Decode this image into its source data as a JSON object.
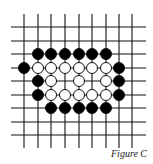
{
  "figure": {
    "caption": "Figure C",
    "grid": {
      "size": 9,
      "x_positions": [
        24,
        38,
        51,
        65,
        79,
        92,
        106,
        119,
        132
      ],
      "y_positions": [
        27,
        41,
        54,
        68,
        81,
        95,
        108,
        122,
        135
      ],
      "line_left": 11,
      "line_right": 146,
      "line_top": 14,
      "line_bottom": 148,
      "line_color": "#111111"
    },
    "stone_radius": 5.5,
    "colors": {
      "black": "#000000",
      "white": "#ffffff",
      "outline": "#111111"
    },
    "stones": [
      {
        "row": 2,
        "col": 1,
        "color": "black"
      },
      {
        "row": 2,
        "col": 2,
        "color": "black"
      },
      {
        "row": 2,
        "col": 3,
        "color": "black"
      },
      {
        "row": 2,
        "col": 4,
        "color": "black"
      },
      {
        "row": 2,
        "col": 5,
        "color": "black"
      },
      {
        "row": 2,
        "col": 6,
        "color": "black"
      },
      {
        "row": 3,
        "col": 0,
        "color": "black"
      },
      {
        "row": 3,
        "col": 1,
        "color": "white"
      },
      {
        "row": 3,
        "col": 2,
        "color": "white"
      },
      {
        "row": 3,
        "col": 3,
        "color": "white"
      },
      {
        "row": 3,
        "col": 4,
        "color": "white"
      },
      {
        "row": 3,
        "col": 5,
        "color": "white"
      },
      {
        "row": 3,
        "col": 6,
        "color": "white"
      },
      {
        "row": 3,
        "col": 7,
        "color": "black"
      },
      {
        "row": 4,
        "col": 1,
        "color": "black"
      },
      {
        "row": 4,
        "col": 2,
        "color": "white"
      },
      {
        "row": 4,
        "col": 4,
        "color": "white"
      },
      {
        "row": 4,
        "col": 6,
        "color": "white"
      },
      {
        "row": 4,
        "col": 7,
        "color": "black"
      },
      {
        "row": 5,
        "col": 1,
        "color": "black"
      },
      {
        "row": 5,
        "col": 2,
        "color": "white"
      },
      {
        "row": 5,
        "col": 3,
        "color": "white"
      },
      {
        "row": 5,
        "col": 4,
        "color": "white"
      },
      {
        "row": 5,
        "col": 5,
        "color": "white"
      },
      {
        "row": 5,
        "col": 6,
        "color": "white"
      },
      {
        "row": 5,
        "col": 7,
        "color": "black"
      },
      {
        "row": 6,
        "col": 2,
        "color": "black"
      },
      {
        "row": 6,
        "col": 3,
        "color": "black"
      },
      {
        "row": 6,
        "col": 4,
        "color": "black"
      },
      {
        "row": 6,
        "col": 5,
        "color": "black"
      },
      {
        "row": 6,
        "col": 6,
        "color": "black"
      }
    ]
  }
}
